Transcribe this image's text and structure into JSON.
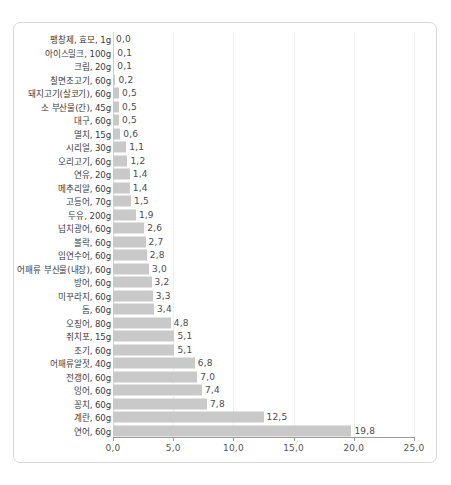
{
  "chart_data": {
    "type": "bar",
    "orientation": "horizontal",
    "title": "",
    "subtitle": "",
    "xlabel": "",
    "ylabel": "",
    "xlim": [
      0.0,
      25.0
    ],
    "xticks": [
      "0,0",
      "5,0",
      "10,0",
      "15,0",
      "20,0",
      "25,0"
    ],
    "xtick_values": [
      0,
      5,
      10,
      15,
      20,
      25
    ],
    "grid": true,
    "grid_axis": "x",
    "legend": false,
    "bar_color": "#c9c9c9",
    "categories": [
      "팽창제, 효모, 1g",
      "아이스밀크, 100g",
      "크림, 20g",
      "칠면조고기, 60g",
      "돼지고기(살코기), 60g",
      "소 부산물(간), 45g",
      "대구, 60g",
      "멸치, 15g",
      "시리얼, 30g",
      "오리고기, 60g",
      "연유, 20g",
      "메추리알, 60g",
      "고등어, 70g",
      "두유, 200g",
      "넙치광어, 60g",
      "볼락, 60g",
      "임연수어, 60g",
      "어패류 부산물(내장), 60g",
      "방어, 60g",
      "미꾸라지, 60g",
      "돔, 60g",
      "오징어, 80g",
      "쥐치포, 15g",
      "조기, 60g",
      "어패류알젓, 40g",
      "전갱이, 60g",
      "잉어, 60g",
      "꽁치, 60g",
      "계란, 60g",
      "연어, 60g"
    ],
    "values": [
      0.0,
      0.1,
      0.1,
      0.2,
      0.5,
      0.5,
      0.5,
      0.6,
      1.1,
      1.2,
      1.4,
      1.4,
      1.5,
      1.9,
      2.6,
      2.7,
      2.8,
      3.0,
      3.2,
      3.3,
      3.4,
      4.8,
      5.1,
      5.1,
      6.8,
      7.0,
      7.4,
      7.8,
      12.5,
      19.8
    ],
    "value_labels": [
      "0,0",
      "0,1",
      "0,1",
      "0,2",
      "0,5",
      "0,5",
      "0,5",
      "0,6",
      "1,1",
      "1,2",
      "1,4",
      "1,4",
      "1,5",
      "1,9",
      "2,6",
      "2,7",
      "2,8",
      "3,0",
      "3,2",
      "3,3",
      "3,4",
      "4,8",
      "5,1",
      "5,1",
      "6,8",
      "7,0",
      "7,4",
      "7,8",
      "12,5",
      "19,8"
    ]
  }
}
